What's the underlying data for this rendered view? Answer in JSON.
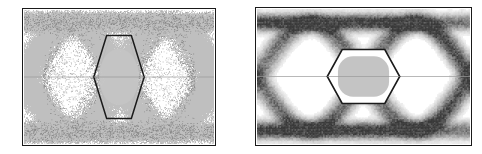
{
  "figure": {
    "title": "",
    "panel_count": 2,
    "background_color": "#ffffff",
    "frame_color": "#1a1a1a"
  },
  "chart_data": [
    {
      "id": "panel-left",
      "type": "scatter",
      "title": "",
      "subtitle": "",
      "xlabel": "",
      "ylabel": "",
      "description": "Measured eye diagram, binary NRZ, dense sampled persistence trace, high-contrast black-on-white",
      "render_style": "speckled-persistence",
      "xlim": [
        -0.5,
        1.5
      ],
      "ylim": [
        -1.0,
        1.0
      ],
      "grid": false,
      "legend": "none",
      "ui_time_axis_units": "unit interval (UI)",
      "trace_color": "#101010",
      "mask_outline_color": "#1a1a1a",
      "mask_inner_color": "#b9b9b9",
      "mask_fill_color": "#c4c4c4",
      "center_line_color": "#9a9a9a",
      "eye_crossings_x": [
        0.0,
        1.0
      ],
      "crossing_level_y": 0.0,
      "high_rail_y": 0.82,
      "low_rail_y": -0.82,
      "rail_thickness": 0.16,
      "jitter_rms_ui": 0.085,
      "noise_amplitude": 0.11,
      "eye_height_fraction": 0.62,
      "eye_width_fraction": 0.72,
      "mask_polygon": {
        "shape": "hexagon",
        "points_ui": [
          [
            0.235,
            0.0
          ],
          [
            0.37,
            0.62
          ],
          [
            0.63,
            0.62
          ],
          [
            0.765,
            0.0
          ],
          [
            0.63,
            -0.62
          ],
          [
            0.37,
            -0.62
          ]
        ]
      },
      "mask_inner_polygon": {
        "shape": "hexagon",
        "points_ui": [
          [
            0.27,
            0.0
          ],
          [
            0.39,
            0.54
          ],
          [
            0.61,
            0.54
          ],
          [
            0.73,
            0.0
          ],
          [
            0.61,
            -0.54
          ],
          [
            0.39,
            -0.54
          ]
        ]
      },
      "mask_center_region": {
        "shape": "circle",
        "center_ui": [
          0.5,
          0.0
        ],
        "radius_x_ui": 0.21,
        "radius_y_ui": 0.42
      },
      "sample_count": 24000
    },
    {
      "id": "panel-right",
      "type": "heatmap",
      "title": "",
      "subtitle": "",
      "xlabel": "",
      "ylabel": "",
      "description": "Simulated eye diagram density map, smooth grayscale persistence, white triangular voids above and below the eye",
      "render_style": "smooth-density",
      "xlim": [
        -0.5,
        1.5
      ],
      "ylim": [
        -1.0,
        1.0
      ],
      "grid": false,
      "legend": "none",
      "ui_time_axis_units": "unit interval (UI)",
      "density_color_low": "#ffffff",
      "density_color_mid": "#b0b0b0",
      "density_color_high": "#4a4a4a",
      "mask_outline_color": "#1a1a1a",
      "mask_fill_color": "#c4c4c4",
      "center_line_color": "#9a9a9a",
      "eye_crossings_x": [
        0.0,
        1.0
      ],
      "crossing_level_y": 0.0,
      "high_rail_y": 0.8,
      "low_rail_y": -0.8,
      "rail_thickness": 0.2,
      "jitter_rms_ui": 0.055,
      "noise_amplitude": 0.09,
      "eye_height_fraction": 0.42,
      "eye_width_fraction": 0.8,
      "void_triangles": [
        {
          "apex_ui": [
            0.22,
            0.3
          ],
          "base_y_ui": 0.66,
          "half_width_ui": 0.16
        },
        {
          "apex_ui": [
            0.78,
            0.3
          ],
          "base_y_ui": 0.66,
          "half_width_ui": 0.16
        },
        {
          "apex_ui": [
            0.22,
            -0.3
          ],
          "base_y_ui": -0.66,
          "half_width_ui": 0.16
        },
        {
          "apex_ui": [
            0.78,
            -0.3
          ],
          "base_y_ui": -0.66,
          "half_width_ui": 0.16
        }
      ],
      "mask_polygon": {
        "shape": "hexagon",
        "points_ui": [
          [
            0.16,
            0.0
          ],
          [
            0.3,
            0.4
          ],
          [
            0.7,
            0.4
          ],
          [
            0.84,
            0.0
          ],
          [
            0.7,
            -0.4
          ],
          [
            0.3,
            -0.4
          ]
        ]
      },
      "mask_center_region": {
        "shape": "stadium",
        "center_ui": [
          0.5,
          0.0
        ],
        "half_width_ui": 0.24,
        "half_height_ui": 0.3
      },
      "sample_count": 24000
    }
  ],
  "panels": {
    "left": {
      "label": "left-eye-diagram",
      "frame_visible": true
    },
    "right": {
      "label": "right-eye-diagram",
      "frame_visible": true
    }
  }
}
